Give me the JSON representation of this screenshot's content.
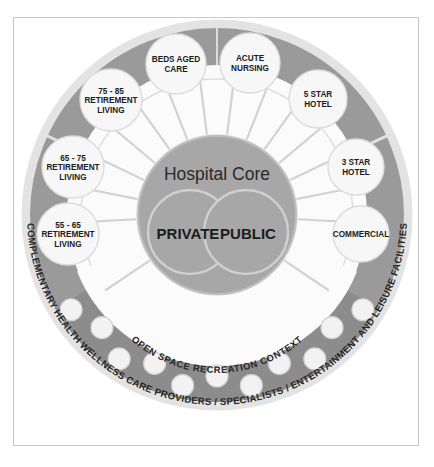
{
  "diagram": {
    "title_core": "Hospital Core",
    "core_split": {
      "left": "PRIVATE",
      "right": "PUBLIC"
    },
    "ring_labels": {
      "middle_ring": "OPEN SPACE RECREATION CONTEXT",
      "outer_ring": "COMPLEMENTARY HEALTH WELLNESS CARE PROVIDERS / SPECIALISTS / ENTERTAINMENT AND LEISURE FACILITIES"
    },
    "bubbles": [
      {
        "id": "beds-aged-care",
        "lines": [
          "BEDS AGED",
          "CARE"
        ],
        "angle_deg": -104,
        "cx": 176,
        "cy": 64,
        "r": 30
      },
      {
        "id": "acute-nursing",
        "lines": [
          "ACUTE",
          "NURSING"
        ],
        "angle_deg": -76,
        "cx": 250,
        "cy": 63,
        "r": 30
      },
      {
        "id": "five-star-hotel",
        "lines": [
          "5 STAR",
          "HOTEL"
        ],
        "angle_deg": -46,
        "cx": 318,
        "cy": 99,
        "r": 29
      },
      {
        "id": "three-star-hotel",
        "lines": [
          "3 STAR",
          "HOTEL"
        ],
        "angle_deg": -14,
        "cx": 356,
        "cy": 167,
        "r": 28
      },
      {
        "id": "commercial",
        "lines": [
          "COMMERCIAL"
        ],
        "angle_deg": 14,
        "cx": 361,
        "cy": 234,
        "r": 28
      },
      {
        "id": "retirement-75-85",
        "lines": [
          "75 - 85",
          "RETIREMENT",
          "LIVING"
        ],
        "angle_deg": -133,
        "cx": 111,
        "cy": 100,
        "r": 31
      },
      {
        "id": "retirement-65-75",
        "lines": [
          "65 - 75",
          "RETIREMENT",
          "LIVING"
        ],
        "angle_deg": -162,
        "cx": 73,
        "cy": 167,
        "r": 31
      },
      {
        "id": "retirement-55-65",
        "lines": [
          "55 - 65",
          "RETIREMENT",
          "LIVING"
        ],
        "angle_deg": 170,
        "cx": 68,
        "cy": 234,
        "r": 31
      }
    ],
    "dot_count": 11,
    "spoke_count": 13,
    "colors": {
      "band_gray": "#9a9a9a",
      "band_gray_dark": "#8c8c8c",
      "core_gray": "#a7a7a7",
      "ring_white": "#fbfbfb",
      "outline_light": "#d6d6d6",
      "text_dark": "#1c1c1c",
      "frame_border": "#c9c9c9",
      "page_bg": "#ffffff"
    }
  }
}
